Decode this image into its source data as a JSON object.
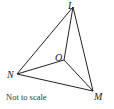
{
  "diagram": {
    "type": "geometry-triangle",
    "stroke_color": "#222222",
    "vertices": {
      "L": {
        "label": "L",
        "x": 73,
        "y": 7
      },
      "M": {
        "label": "M",
        "x": 93,
        "y": 91
      },
      "N": {
        "label": "N",
        "x": 17,
        "y": 74
      },
      "O": {
        "label": "O",
        "x": 64,
        "y": 60
      }
    },
    "edges": [
      [
        "L",
        "M"
      ],
      [
        "M",
        "N"
      ],
      [
        "N",
        "L"
      ],
      [
        "O",
        "L"
      ],
      [
        "O",
        "M"
      ],
      [
        "O",
        "N"
      ]
    ],
    "note": "Not to scale"
  }
}
